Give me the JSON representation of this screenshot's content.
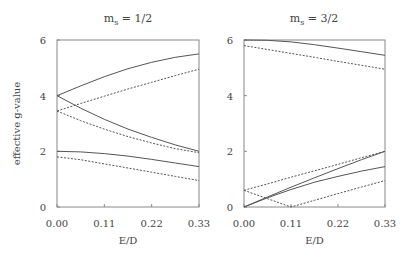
{
  "chart_data": [
    {
      "type": "line",
      "title": "m_s = 1/2",
      "title_main": "m",
      "title_sub": "s",
      "title_rest": " = 1/2",
      "xlabel": "E/D",
      "ylabel": "effective g-value",
      "xlim": [
        0,
        0.33
      ],
      "ylim": [
        0,
        6
      ],
      "xticks": [
        "0.00",
        "0.11",
        "0.22",
        "0.33"
      ],
      "yticks": [
        "0",
        "2",
        "4",
        "6"
      ],
      "grid": false,
      "x": [
        0,
        0.055,
        0.11,
        0.165,
        0.22,
        0.275,
        0.33
      ],
      "series": [
        {
          "name": "solid upper",
          "style": "solid",
          "values": [
            4.0,
            4.35,
            4.68,
            4.97,
            5.2,
            5.38,
            5.5
          ]
        },
        {
          "name": "solid middle",
          "style": "solid",
          "values": [
            4.0,
            3.55,
            3.15,
            2.8,
            2.5,
            2.23,
            2.0
          ]
        },
        {
          "name": "solid lower",
          "style": "solid",
          "values": [
            2.0,
            1.98,
            1.92,
            1.83,
            1.71,
            1.58,
            1.45
          ]
        },
        {
          "name": "dashed upper",
          "style": "dashed",
          "values": [
            3.45,
            3.72,
            3.98,
            4.24,
            4.48,
            4.72,
            4.95
          ]
        },
        {
          "name": "dashed middle",
          "style": "dashed",
          "values": [
            3.45,
            3.1,
            2.8,
            2.53,
            2.3,
            2.1,
            1.95
          ]
        },
        {
          "name": "dashed lower",
          "style": "dashed",
          "values": [
            1.8,
            1.7,
            1.55,
            1.4,
            1.25,
            1.1,
            0.95
          ]
        }
      ]
    },
    {
      "type": "line",
      "title": "m_s = 3/2",
      "title_main": "m",
      "title_sub": "s",
      "title_rest": " = 3/2",
      "xlabel": "E/D",
      "ylabel": "",
      "xlim": [
        0,
        0.33
      ],
      "ylim": [
        0,
        6
      ],
      "xticks": [
        "0.00",
        "0.11",
        "0.22",
        "0.33"
      ],
      "yticks": [
        "0",
        "2",
        "4",
        "6"
      ],
      "grid": false,
      "x": [
        0,
        0.055,
        0.11,
        0.165,
        0.22,
        0.275,
        0.33
      ],
      "series": [
        {
          "name": "solid upper",
          "style": "solid",
          "values": [
            6.0,
            5.99,
            5.93,
            5.83,
            5.71,
            5.58,
            5.45
          ]
        },
        {
          "name": "dashed upper",
          "style": "dashed",
          "values": [
            5.8,
            5.66,
            5.52,
            5.38,
            5.23,
            5.09,
            4.95
          ]
        },
        {
          "name": "solid lower steep",
          "style": "solid",
          "values": [
            0.0,
            0.36,
            0.71,
            1.05,
            1.38,
            1.7,
            2.0
          ]
        },
        {
          "name": "solid lower shallow",
          "style": "solid",
          "values": [
            0.0,
            0.33,
            0.63,
            0.89,
            1.1,
            1.29,
            1.45
          ]
        },
        {
          "name": "dashed rising",
          "style": "dashed",
          "values": [
            0.6,
            0.83,
            1.07,
            1.3,
            1.53,
            1.77,
            2.0
          ]
        },
        {
          "name": "dashed V",
          "style": "dashed",
          "values": [
            0.6,
            0.3,
            0.0,
            0.24,
            0.48,
            0.72,
            0.95
          ]
        }
      ]
    }
  ],
  "colors": {
    "axis": "#888888",
    "line": "#555555",
    "text": "#444444"
  }
}
